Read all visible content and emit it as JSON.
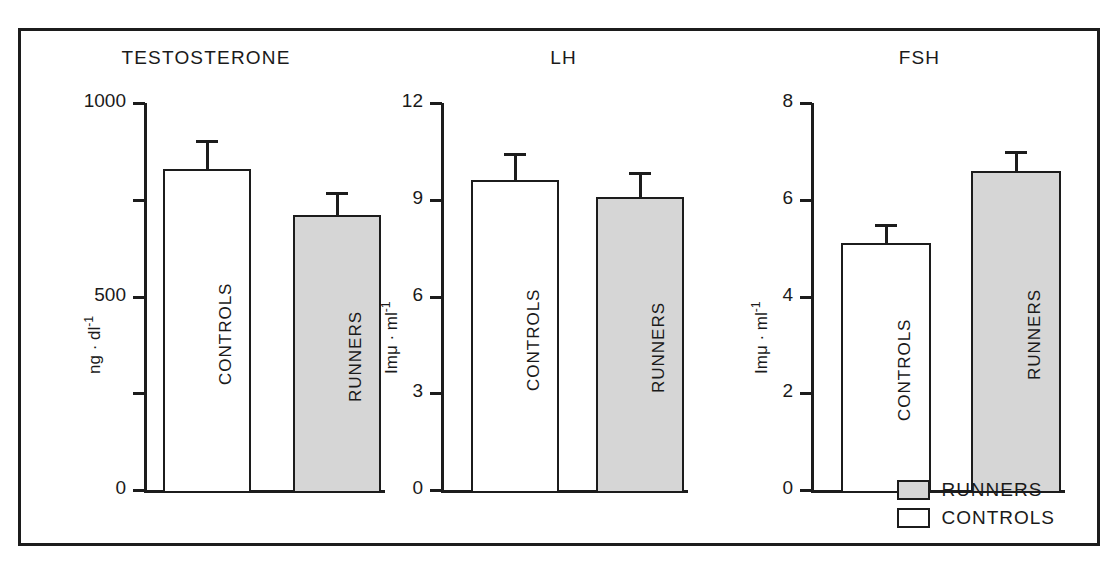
{
  "figure": {
    "background": "#ffffff",
    "frame_color": "#1c1c1c",
    "runners_fill": "#d6d6d6",
    "controls_fill": "#ffffff"
  },
  "legend": {
    "position": "bottom-right",
    "items": [
      {
        "label": "RUNNERS",
        "fill": "#d6d6d6",
        "swatch_name": "legend-swatch-runners"
      },
      {
        "label": "CONTROLS",
        "fill": "#ffffff",
        "swatch_name": "legend-swatch-controls"
      }
    ]
  },
  "chart_data": [
    {
      "type": "bar",
      "title": "TESTOSTERONE",
      "xlabel": "",
      "ylabel": "ng · dl⁻¹",
      "ylabel_base": "ng · dl",
      "ylabel_exp": "-1",
      "ylim": [
        0,
        1000
      ],
      "yticks": [
        0,
        500,
        1000
      ],
      "ytick_labels": [
        "0",
        "500",
        "1000"
      ],
      "yminor_ticks": [
        250,
        750
      ],
      "grid": false,
      "categories": [
        "CONTROLS",
        "RUNNERS"
      ],
      "values": [
        830,
        710
      ],
      "errors": [
        75,
        60
      ],
      "fills": [
        "#ffffff",
        "#d6d6d6"
      ]
    },
    {
      "type": "bar",
      "title": "LH",
      "xlabel": "",
      "ylabel": "Imμ · ml⁻¹",
      "ylabel_base": "Imμ · ml",
      "ylabel_exp": "-1",
      "ylim": [
        0,
        12
      ],
      "yticks": [
        0,
        3,
        6,
        9,
        12
      ],
      "ytick_labels": [
        "0",
        "3",
        "6",
        "9",
        "12"
      ],
      "yminor_ticks": [],
      "grid": false,
      "categories": [
        "CONTROLS",
        "RUNNERS"
      ],
      "values": [
        9.6,
        9.1
      ],
      "errors": [
        0.85,
        0.75
      ],
      "fills": [
        "#ffffff",
        "#d6d6d6"
      ]
    },
    {
      "type": "bar",
      "title": "FSH",
      "xlabel": "",
      "ylabel": "Imμ · ml⁻¹",
      "ylabel_base": "Imμ · ml",
      "ylabel_exp": "-1",
      "ylim": [
        0,
        8
      ],
      "yticks": [
        0,
        2,
        4,
        6,
        8
      ],
      "ytick_labels": [
        "0",
        "2",
        "4",
        "6",
        "8"
      ],
      "yminor_ticks": [],
      "grid": false,
      "categories": [
        "CONTROLS",
        "RUNNERS"
      ],
      "values": [
        5.1,
        6.6
      ],
      "errors": [
        0.4,
        0.4
      ],
      "fills": [
        "#ffffff",
        "#d6d6d6"
      ]
    }
  ]
}
